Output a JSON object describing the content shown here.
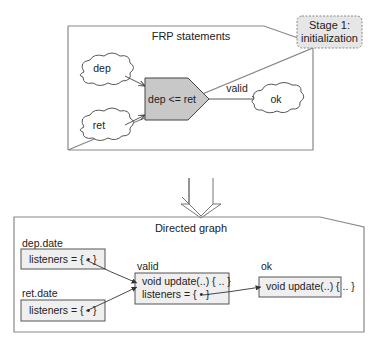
{
  "stage_label": {
    "line1": "Stage 1:",
    "line2": "initialization"
  },
  "frp_panel": {
    "title": "FRP statements",
    "clouds": {
      "dep": "dep",
      "ret": "ret",
      "ok": "ok"
    },
    "operator": "dep <= ret",
    "edge_label": "valid"
  },
  "graph_panel": {
    "title": "Directed graph",
    "nodes": {
      "dep_date": {
        "name": "dep.date",
        "line1": "listeners = {  •  }"
      },
      "ret_date": {
        "name": "ret.date",
        "line1": "listeners = {  •  }"
      },
      "valid": {
        "name": "valid",
        "line1": "void update(..) { .. }",
        "line2": "listeners = {  •  }"
      },
      "ok": {
        "name": "ok",
        "line1": "void update(..) { .. }"
      }
    }
  },
  "colors": {
    "panel_border": "#888888",
    "operator_fill": "#c8c8c8",
    "node_fill": "#efefef",
    "stage_fill": "#e6e6e6"
  }
}
